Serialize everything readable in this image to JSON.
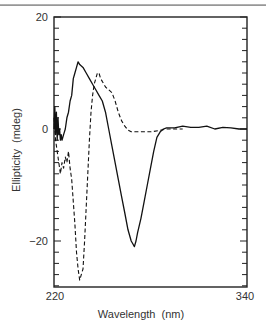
{
  "chart_data": {
    "type": "line",
    "title": "",
    "xlabel": "Wavelength  (nm)",
    "ylabel": "Ellipticity  (mdeg)",
    "xlim": [
      220,
      340
    ],
    "ylim": [
      -28.2,
      20
    ],
    "x_tick_labels": [
      "220",
      "340"
    ],
    "y_tick_labels": [
      "20",
      "0",
      "−20"
    ],
    "y_minor_tick_step": 2,
    "grid": false,
    "legend": null,
    "series": [
      {
        "name": "solid",
        "style": "solid",
        "color": "#111111",
        "x": [
          220,
          220.5,
          221,
          221.5,
          222,
          222.5,
          223,
          223.5,
          224,
          224.5,
          225,
          226,
          227,
          228,
          229,
          230,
          231,
          232,
          233,
          234,
          235,
          236,
          238,
          240,
          242,
          244,
          246,
          248,
          250,
          252,
          254,
          256,
          258,
          260,
          262,
          264,
          266,
          268,
          269,
          270,
          271,
          272,
          274,
          276,
          278,
          280,
          282,
          284,
          286,
          288,
          290,
          295,
          300,
          305,
          310,
          315,
          320,
          325,
          330,
          335,
          340
        ],
        "y": [
          0,
          4,
          -1,
          3,
          -2,
          2,
          -1,
          0,
          -2,
          -1,
          -2,
          -1,
          0,
          2,
          3,
          5,
          6,
          9,
          10,
          11,
          12,
          11.5,
          11,
          10,
          9,
          8,
          7,
          6,
          5,
          3,
          0,
          -3,
          -6,
          -9,
          -12,
          -15,
          -18,
          -20,
          -20.5,
          -21,
          -20,
          -18.5,
          -16,
          -13,
          -10,
          -7,
          -4,
          -1.5,
          -0.5,
          0,
          0.2,
          0.2,
          0.5,
          0.3,
          0.3,
          0.5,
          0,
          0.3,
          0.2,
          0,
          0
        ]
      },
      {
        "name": "dashed",
        "style": "dashed",
        "color": "#111111",
        "x": [
          220,
          221,
          222,
          223,
          224,
          225,
          226,
          227,
          228,
          229,
          230,
          231,
          232,
          233,
          234,
          235,
          236,
          237,
          238,
          239,
          240,
          241,
          242,
          243,
          244,
          245,
          246,
          247,
          248,
          249,
          250,
          252,
          254,
          256,
          258,
          260,
          262,
          264,
          266,
          268,
          270,
          275,
          280,
          285,
          290,
          295,
          300
        ],
        "y": [
          2,
          -2,
          -4,
          -6,
          -8,
          -6,
          -7,
          -5,
          -6,
          -4,
          -7,
          -9,
          -13,
          -17,
          -22,
          -25,
          -27,
          -26,
          -25,
          -20,
          -14,
          -8,
          -2,
          3,
          6,
          8,
          9,
          10,
          10,
          9,
          8.5,
          7.5,
          7,
          6.5,
          5,
          3,
          1.5,
          0.5,
          -0.2,
          -0.5,
          -0.5,
          -0.5,
          -0.5,
          -0.3,
          0,
          0,
          0
        ]
      }
    ]
  }
}
